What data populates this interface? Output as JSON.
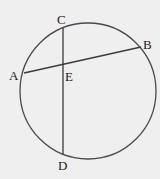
{
  "diagram": {
    "type": "circle-intersecting-chords",
    "background": "#efefef",
    "stroke_color": "#4a4a4a",
    "circle": {
      "cx": 88,
      "cy": 91,
      "r": 68
    },
    "chords": [
      {
        "name": "AB",
        "from": "A",
        "to": "B"
      },
      {
        "name": "CD",
        "from": "C",
        "to": "D"
      }
    ],
    "points": {
      "A": {
        "label": "A",
        "x": 24,
        "y": 73
      },
      "B": {
        "label": "B",
        "x": 141,
        "y": 47
      },
      "C": {
        "label": "C",
        "x": 63,
        "y": 28
      },
      "D": {
        "label": "D",
        "x": 63,
        "y": 154
      },
      "E": {
        "label": "E",
        "x": 63,
        "y": 64
      }
    }
  }
}
